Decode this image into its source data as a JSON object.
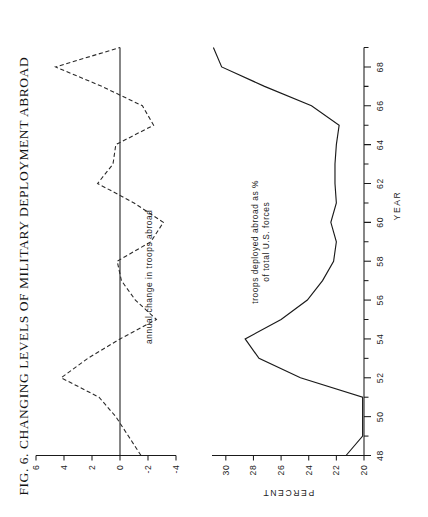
{
  "figure": {
    "title_prefix": "F",
    "title_small": "IG",
    "title": "FIG. 6. CHANGING LEVELS OF MILITARY DEPLOYMENT ABROAD",
    "background": "#ffffff",
    "ink": "#1a1a1a"
  },
  "chart_data": [
    {
      "type": "line",
      "id": "annual-change",
      "title": "annual change in troops abroad",
      "annotation": "annual change in troops abroad",
      "xlabel": "",
      "ylabel": "",
      "grid": false,
      "legend": "inline-annotation",
      "line_style": "dashed",
      "xlim": [
        48,
        69
      ],
      "ylim": [
        -4,
        6
      ],
      "yticks": [
        6,
        4,
        2,
        0,
        -2,
        -4
      ],
      "ytick_labels": [
        "6",
        "4",
        "2",
        "0",
        "-2",
        "-4"
      ],
      "zero_line": true,
      "x": [
        48,
        49,
        50,
        51,
        52,
        53,
        54,
        55,
        56,
        57,
        58,
        59,
        60,
        61,
        62,
        63,
        64,
        65,
        66,
        67,
        68,
        69
      ],
      "values": [
        -1.5,
        -0.6,
        0.3,
        1.5,
        4.2,
        2.3,
        0.0,
        -2.6,
        -1.1,
        -0.1,
        0.2,
        -2.2,
        -3.1,
        -1.0,
        1.6,
        0.5,
        0.3,
        -2.4,
        -1.6,
        1.3,
        4.6,
        0.0
      ]
    },
    {
      "type": "line",
      "id": "percent-abroad",
      "title": "troops deployed abroad as % of total U.S. forces",
      "annotation_line1": "troops deployed abroad as %",
      "annotation_line2": "of total U.S. forces",
      "xlabel": "YEAR",
      "ylabel": "PERCENT",
      "grid": false,
      "line_style": "solid",
      "xlim": [
        48,
        69
      ],
      "ylim": [
        20,
        31
      ],
      "yticks": [
        20,
        22,
        24,
        26,
        28,
        30
      ],
      "ytick_labels": [
        "20",
        "22",
        "24",
        "26",
        "28",
        "30"
      ],
      "xticks": [
        48,
        49,
        50,
        51,
        52,
        53,
        54,
        55,
        56,
        57,
        58,
        59,
        60,
        61,
        62,
        63,
        64,
        65,
        66,
        67,
        68,
        69
      ],
      "xtick_labels": [
        "48",
        "",
        "50",
        "",
        "52",
        "",
        "54",
        "",
        "56",
        "",
        "58",
        "",
        "60",
        "",
        "62",
        "",
        "64",
        "",
        "66",
        "",
        "68",
        ""
      ],
      "x": [
        48,
        49,
        50,
        51,
        52,
        53,
        54,
        55,
        56,
        57,
        58,
        59,
        60,
        61,
        62,
        63,
        64,
        65,
        66,
        67,
        68,
        69
      ],
      "values": [
        21.3,
        20.1,
        20.1,
        20.1,
        24.6,
        27.6,
        28.6,
        26.0,
        24.1,
        23.0,
        22.2,
        22.0,
        22.4,
        22.0,
        22.1,
        22.1,
        22.0,
        21.8,
        23.8,
        27.2,
        30.3,
        30.9
      ]
    }
  ],
  "axes": {
    "year_axis_label": "YEAR",
    "percent_axis_label": "PERCENT"
  }
}
